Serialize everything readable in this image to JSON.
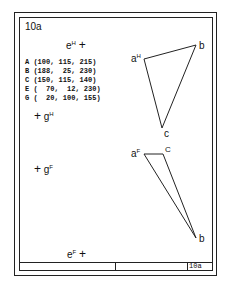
{
  "sheet": {
    "title": "10a",
    "footer_label": "10a"
  },
  "coordinates": [
    "A (100, 115, 215)",
    "B (188,  25, 230)",
    "C (150, 115, 140)",
    "E (  70,  12, 230)",
    "G (  20, 100, 155)"
  ],
  "labels": {
    "eH": {
      "base": "e",
      "sup": "H",
      "mark": "+"
    },
    "gH": {
      "base": "g",
      "sup": "H",
      "mark": "+"
    },
    "gF": {
      "base": "g",
      "sup": "F",
      "mark": "+"
    },
    "eF": {
      "base": "e",
      "sup": "F",
      "mark": "+"
    },
    "aH": {
      "base": "a",
      "sup": "H"
    },
    "bH": "b",
    "cH": "c",
    "aF": {
      "base": "a",
      "sup": "F"
    },
    "bF": "b",
    "cF": "C"
  },
  "triangles": {
    "horizontal_view": {
      "a": [
        144,
        59
      ],
      "b": [
        196,
        45
      ],
      "c": [
        162,
        128
      ]
    },
    "frontal_view": {
      "a": [
        144,
        154
      ],
      "c": [
        163,
        154
      ],
      "b": [
        196,
        238
      ]
    }
  }
}
